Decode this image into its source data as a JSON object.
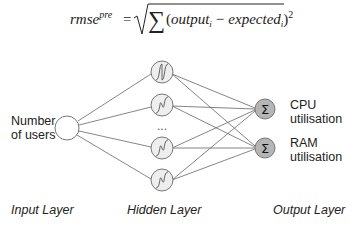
{
  "formula": {
    "lhs_base": "rmse",
    "lhs_superscript": "pre",
    "equals": "=",
    "sigma": "∑",
    "open_paren": "(",
    "term1": "output",
    "term1_subscript": "i",
    "minus": "−",
    "term2": "expected",
    "term2_subscript": "i",
    "close_paren": ")",
    "exponent": "2"
  },
  "input_node": {
    "label_line1": "Number",
    "label_line2": "of users"
  },
  "hidden_layer": {
    "node_count_shown": 4,
    "activation_icon": "sigmoid-icon",
    "ellipsis": "..."
  },
  "output_nodes": [
    {
      "icon": "sigma-icon",
      "glyph": "Σ",
      "label_line1": "CPU",
      "label_line2": "utilisation"
    },
    {
      "icon": "sigma-icon",
      "glyph": "Σ",
      "label_line1": "RAM",
      "label_line2": "utilisation"
    }
  ],
  "layer_labels": {
    "input": "Input Layer",
    "hidden": "Hidden Layer",
    "output": "Output Layer"
  },
  "colors": {
    "node_stroke": "#777777",
    "hidden_fill": "#eeeeee",
    "input_fill": "#ffffff",
    "output_fill": "#b5b5b5",
    "edge": "#666666",
    "text": "#222222"
  }
}
